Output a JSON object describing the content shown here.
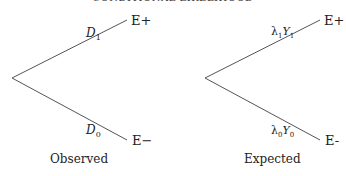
{
  "header": {
    "title": "CONDITIONAL LIKELIHOOD"
  },
  "trees": [
    {
      "caption": "Observed",
      "upper": {
        "leaf": "E+",
        "branch_label": "D",
        "branch_sub": "1",
        "branch_prefix": ""
      },
      "lower": {
        "leaf": "E−",
        "branch_label": "D",
        "branch_sub": "0",
        "branch_prefix": ""
      }
    },
    {
      "caption": "Expected",
      "upper": {
        "leaf": "E+",
        "branch_label": "Y",
        "branch_sub": "1",
        "branch_prefix": "λ",
        "prefix_sub": "1"
      },
      "lower": {
        "leaf": "E-",
        "branch_label": "Y",
        "branch_sub": "0",
        "branch_prefix": "λ",
        "prefix_sub": "0"
      }
    }
  ]
}
